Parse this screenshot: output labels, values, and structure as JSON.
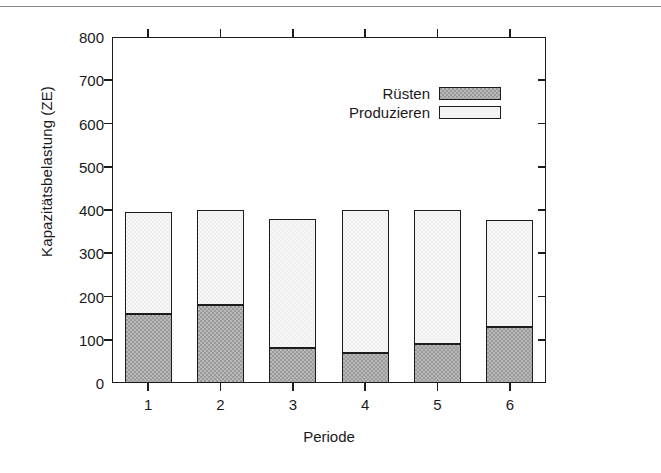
{
  "chart_data": {
    "type": "bar",
    "subtype": "stacked-vertical",
    "title": "",
    "xlabel": "Periode",
    "ylabel": "Kapazitätsbelastung (ZE)",
    "categories": [
      "1",
      "2",
      "3",
      "4",
      "5",
      "6"
    ],
    "series": [
      {
        "name": "Rüsten",
        "values": [
          160,
          180,
          80,
          70,
          90,
          130
        ],
        "color": "#9a9a9a"
      },
      {
        "name": "Produzieren",
        "values": [
          235,
          220,
          300,
          330,
          310,
          248
        ],
        "color": "#f6f6f6"
      }
    ],
    "totals": [
      395,
      400,
      380,
      400,
      400,
      378
    ],
    "ylim": [
      0,
      800
    ],
    "ytick_values": [
      0,
      100,
      200,
      300,
      400,
      500,
      600,
      700,
      800
    ],
    "ytick_labels": [
      "0",
      "100",
      "200",
      "300",
      "400",
      "500",
      "600",
      "700",
      "800"
    ],
    "grid": false,
    "legend_position": "top-center",
    "legend_entries": [
      "Rüsten",
      "Produzieren"
    ],
    "axis_ticks_all_sides": true,
    "frame_color": "#1c1c1c"
  }
}
